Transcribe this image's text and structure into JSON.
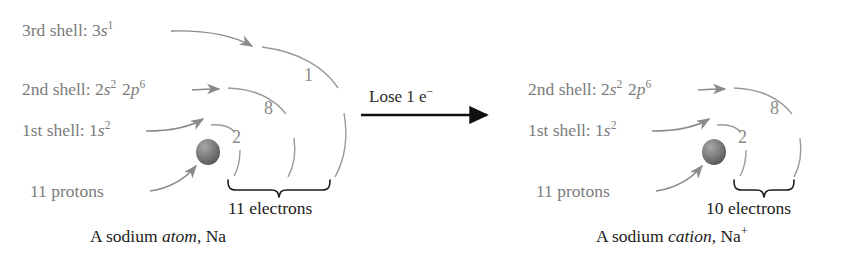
{
  "diagram": {
    "colors": {
      "label_gray": "#7b7b7b",
      "arc_gray": "#8a8a8a",
      "text_black": "#1b1b1b",
      "arrow_black": "#111111",
      "nucleus_dark": "#5f5f5f",
      "nucleus_light": "#9a9a9a",
      "background": "#ffffff"
    }
  },
  "left": {
    "caption": {
      "prefix": "A sodium ",
      "emphasis": "atom",
      "suffix": ", Na",
      "charge": ""
    },
    "nucleus_label": "11 protons",
    "electrons_total": "11 electrons",
    "shells": [
      {
        "name": "shell-3",
        "label_prefix": "3rd shell: ",
        "orbitals": [
          {
            "n": "3",
            "letter": "s",
            "electrons": "1"
          }
        ],
        "arc_count": "1"
      },
      {
        "name": "shell-2",
        "label_prefix": "2nd shell: ",
        "orbitals": [
          {
            "n": "2",
            "letter": "s",
            "electrons": "2"
          },
          {
            "n": "2",
            "letter": "p",
            "electrons": "6"
          }
        ],
        "arc_count": "8"
      },
      {
        "name": "shell-1",
        "label_prefix": "1st shell: ",
        "orbitals": [
          {
            "n": "1",
            "letter": "s",
            "electrons": "2"
          }
        ],
        "arc_count": "2"
      }
    ]
  },
  "transition": {
    "label_text": "Lose 1 e",
    "label_charge": "−",
    "arrow": "right-arrow"
  },
  "right": {
    "caption": {
      "prefix": "A sodium ",
      "emphasis": "cation",
      "suffix": ", Na",
      "charge": "+"
    },
    "nucleus_label": "11 protons",
    "electrons_total": "10 electrons",
    "shells": [
      {
        "name": "shell-2",
        "label_prefix": "2nd shell: ",
        "orbitals": [
          {
            "n": "2",
            "letter": "s",
            "electrons": "2"
          },
          {
            "n": "2",
            "letter": "p",
            "electrons": "6"
          }
        ],
        "arc_count": "8"
      },
      {
        "name": "shell-1",
        "label_prefix": "1st shell: ",
        "orbitals": [
          {
            "n": "1",
            "letter": "s",
            "electrons": "2"
          }
        ],
        "arc_count": "2"
      }
    ]
  }
}
